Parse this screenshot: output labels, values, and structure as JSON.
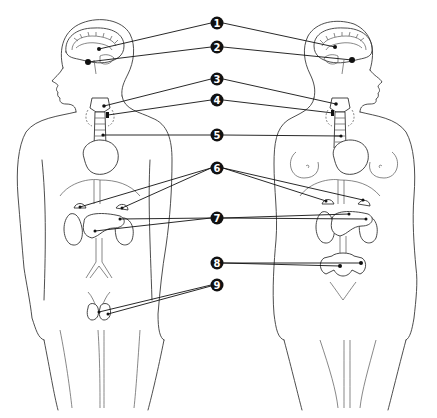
{
  "diagram": {
    "figures": [
      "male",
      "female"
    ],
    "callouts": [
      {
        "number": "1",
        "cx": 217,
        "cy": 23,
        "targets": [
          [
            99,
            49
          ],
          [
            335,
            47
          ]
        ]
      },
      {
        "number": "2",
        "cx": 217,
        "cy": 47,
        "targets": [
          [
            88,
            62
          ],
          [
            352,
            60
          ]
        ]
      },
      {
        "number": "3",
        "cx": 217,
        "cy": 79,
        "targets": [
          [
            104,
            106
          ],
          [
            336,
            104
          ]
        ]
      },
      {
        "number": "4",
        "cx": 217,
        "cy": 100,
        "targets": [
          [
            108,
            115
          ],
          [
            333,
            113
          ]
        ]
      },
      {
        "number": "5",
        "cx": 217,
        "cy": 135,
        "targets": [
          [
            103,
            135
          ],
          [
            341,
            136
          ]
        ]
      },
      {
        "number": "6",
        "cx": 217,
        "cy": 168,
        "targets": [
          [
            80,
            207
          ],
          [
            122,
            208
          ],
          [
            326,
            201
          ],
          [
            363,
            200
          ]
        ]
      },
      {
        "number": "7",
        "cx": 217,
        "cy": 218,
        "targets": [
          [
            120,
            219
          ],
          [
            95,
            231
          ],
          [
            349,
            214
          ],
          [
            366,
            219
          ]
        ]
      },
      {
        "number": "8",
        "cx": 217,
        "cy": 263,
        "targets": [
          [
            340,
            266
          ],
          [
            361,
            263
          ]
        ]
      },
      {
        "number": "9",
        "cx": 217,
        "cy": 285,
        "targets": [
          [
            99,
            312
          ],
          [
            108,
            313
          ]
        ]
      }
    ]
  }
}
